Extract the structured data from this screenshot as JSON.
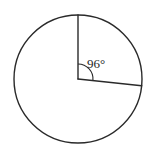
{
  "figure": {
    "type": "circle-with-central-angle",
    "background_color": "#ffffff",
    "stroke_color": "#2a2a2a",
    "label_color": "#1f1f1f",
    "circle": {
      "center_x": 78,
      "center_y": 79,
      "radius": 64,
      "stroke_width": 1.4
    },
    "radii": [
      {
        "name": "vertical-radius",
        "direction_degrees_from_up": 0,
        "end_x": 78,
        "end_y": 15
      },
      {
        "name": "angled-radius",
        "direction_degrees_from_up": 96,
        "end_x": 141.6,
        "end_y": 85.7
      }
    ],
    "angle_arc": {
      "radius": 15,
      "start_degrees_from_up": 0,
      "end_degrees_from_up": 96
    },
    "angle_label": {
      "text": "96°",
      "value": 96,
      "unit": "degrees",
      "x": 87,
      "y": 65
    }
  }
}
